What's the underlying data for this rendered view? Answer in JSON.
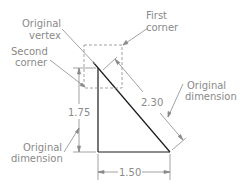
{
  "diagram": {
    "labels": {
      "original_vertex_line1": "Original",
      "original_vertex_line2": "vertex",
      "second_corner_line1": "Second",
      "second_corner_line2": "corner",
      "first_corner_line1": "First",
      "first_corner_line2": "corner",
      "original_dimension_right_line1": "Original",
      "original_dimension_right_line2": "dimension",
      "original_dimension_left_line1": "Original",
      "original_dimension_left_line2": "dimension"
    },
    "dimensions": {
      "vertical": "1.75",
      "horizontal": "1.50",
      "aligned": "2.30"
    },
    "colors": {
      "geometry": "#1a1a1a",
      "annotation": "#8a8a8a",
      "dashed": "#8a8a8a"
    }
  }
}
